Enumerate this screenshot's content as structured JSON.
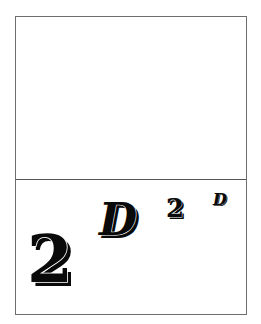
{
  "panels": {
    "top": {
      "content": ""
    },
    "bottom": {
      "glyphs": [
        {
          "text": "2",
          "size": "large"
        },
        {
          "text": "D",
          "size": "medium"
        },
        {
          "text": "2",
          "size": "small"
        },
        {
          "text": "D",
          "size": "tiny"
        }
      ]
    }
  },
  "colors": {
    "fill": "#0a0a0a",
    "outline": "#ffffff",
    "frame": "#6e6e6e"
  }
}
